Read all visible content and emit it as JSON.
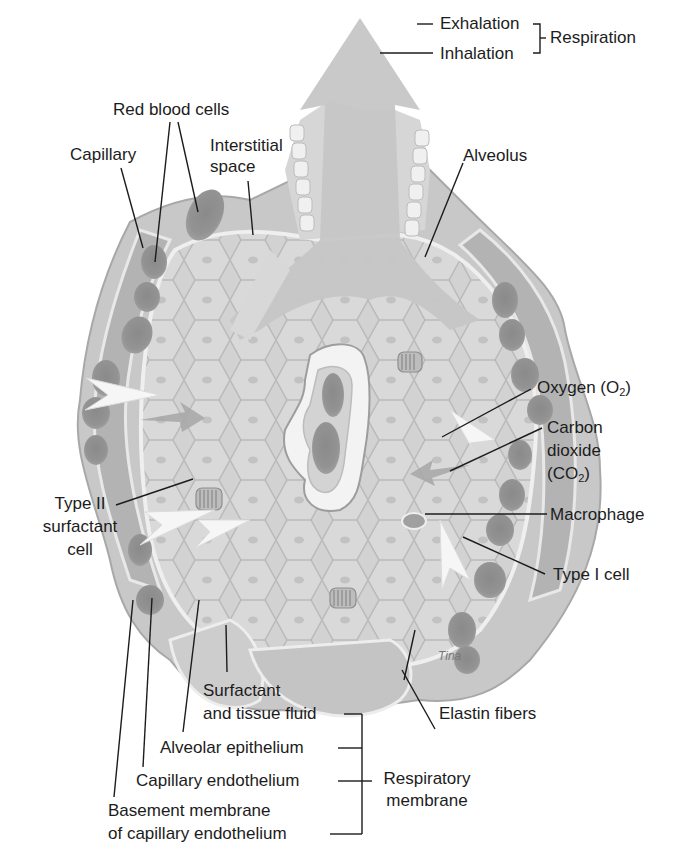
{
  "diagram": {
    "style": "grayscale anatomical illustration",
    "colors": {
      "background": "#ffffff",
      "tissue_light": "#dcdcdc",
      "tissue_mid": "#bdbdbd",
      "tissue_dark": "#9a9a9a",
      "rbc": "#8c8c8c",
      "airway_arrow": "#c8c8c8",
      "gas_arrow": "#f4f4f4",
      "label_text": "#1c1c1c",
      "leader_line": "#1c1c1c"
    },
    "labels": {
      "exhalation": "Exhalation",
      "inhalation": "Inhalation",
      "respiration": "Respiration",
      "red_blood_cells": "Red blood cells",
      "capillary": "Capillary",
      "interstitial_space_1": "Interstitial",
      "interstitial_space_2": "space",
      "alveolus": "Alveolus",
      "oxygen": "Oxygen (O",
      "oxygen_sub": "2",
      "oxygen_close": ")",
      "carbon_dioxide_1": "Carbon",
      "carbon_dioxide_2": "dioxide",
      "carbon_dioxide_3": "(CO",
      "carbon_dioxide_sub": "2",
      "carbon_dioxide_close": ")",
      "macrophage": "Macrophage",
      "type_i_cell": "Type I cell",
      "type_ii_1": "Type II",
      "type_ii_2": "surfactant",
      "type_ii_3": "cell",
      "surfactant_1": "Surfactant",
      "surfactant_2": "and tissue fluid",
      "elastin_fibers": "Elastin fibers",
      "alveolar_epithelium": "Alveolar epithelium",
      "capillary_endothelium": "Capillary endothelium",
      "basement_membrane_1": "Basement membrane",
      "basement_membrane_2": "of capillary endothelium",
      "respiratory_membrane_1": "Respiratory",
      "respiratory_membrane_2": "membrane"
    },
    "groups": {
      "respiration": [
        "Exhalation",
        "Inhalation"
      ],
      "respiratory_membrane": [
        "Surfactant and tissue fluid",
        "Alveolar epithelium",
        "Capillary endothelium",
        "Basement membrane of capillary endothelium"
      ]
    },
    "signature": "Tina"
  }
}
